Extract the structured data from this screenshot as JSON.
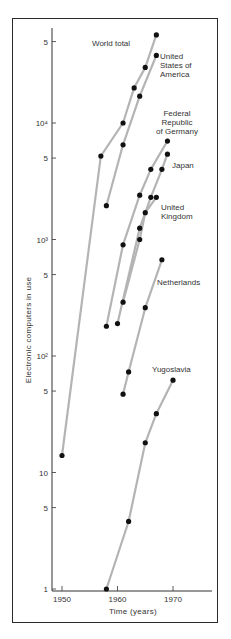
{
  "chart_data": {
    "type": "line",
    "title": "",
    "xlabel": "Time  (years)",
    "ylabel": "Electronic computers in use",
    "yscale": "log",
    "ylim": [
      1,
      60000
    ],
    "xlim": [
      1948,
      1976
    ],
    "grid": false,
    "legend": "inline labels",
    "x_ticks": [
      {
        "value": 1950,
        "label": "1950"
      },
      {
        "value": 1960,
        "label": "1960"
      },
      {
        "value": 1970,
        "label": "1970"
      }
    ],
    "y_ticks": [
      {
        "value": 1,
        "label": "1"
      },
      {
        "value": 5,
        "label": "5"
      },
      {
        "value": 10,
        "label": "10"
      },
      {
        "value": 50,
        "label": "5"
      },
      {
        "value": 100,
        "label": "10²"
      },
      {
        "value": 500,
        "label": "5"
      },
      {
        "value": 1000,
        "label": "10³"
      },
      {
        "value": 5000,
        "label": "5"
      },
      {
        "value": 10000,
        "label": "10⁴"
      },
      {
        "value": 50000,
        "label": "5"
      }
    ],
    "series": [
      {
        "name": "World  total",
        "label_lines": [
          "World  total"
        ],
        "label_pos": [
          92,
          46
        ],
        "label_anchor": "start",
        "points": [
          [
            1950,
            14
          ],
          [
            1957,
            5200
          ],
          [
            1961,
            10000
          ],
          [
            1963,
            20000
          ],
          [
            1965,
            30000
          ],
          [
            1967,
            57000
          ]
        ]
      },
      {
        "name": "United States of America",
        "label_lines": [
          "United",
          "States  of",
          "America"
        ],
        "label_pos": [
          160,
          59
        ],
        "label_anchor": "start",
        "points": [
          [
            1958,
            1950
          ],
          [
            1961,
            6500
          ],
          [
            1964,
            17000
          ],
          [
            1967,
            38000
          ]
        ]
      },
      {
        "name": "Federal Republic of Germany",
        "label_lines": [
          "Federal",
          "Republic",
          "of  Germany"
        ],
        "label_pos": [
          177,
          116
        ],
        "label_anchor": "middle",
        "points": [
          [
            1958,
            180
          ],
          [
            1961,
            900
          ],
          [
            1964,
            2400
          ],
          [
            1966,
            4000
          ],
          [
            1969,
            7000
          ]
        ]
      },
      {
        "name": "Japan",
        "label_lines": [
          "Japan"
        ],
        "label_pos": [
          172,
          168
        ],
        "label_anchor": "start",
        "points": [
          [
            1960,
            190
          ],
          [
            1964,
            1250
          ],
          [
            1966,
            2300
          ],
          [
            1968,
            4000
          ],
          [
            1969,
            5400
          ]
        ]
      },
      {
        "name": "United Kingdom",
        "label_lines": [
          "United",
          "Kingdom"
        ],
        "label_pos": [
          161,
          210
        ],
        "label_anchor": "start",
        "points": [
          [
            1961,
            290
          ],
          [
            1964,
            1000
          ],
          [
            1965,
            1700
          ],
          [
            1967,
            2300
          ]
        ]
      },
      {
        "name": "Netherlands",
        "label_lines": [
          "Netherlands"
        ],
        "label_pos": [
          157,
          285
        ],
        "label_anchor": "start",
        "points": [
          [
            1961,
            47
          ],
          [
            1962,
            73
          ],
          [
            1965,
            260
          ],
          [
            1968,
            670
          ]
        ]
      },
      {
        "name": "Yugoslavia",
        "label_lines": [
          "Yugoslavia"
        ],
        "label_pos": [
          152,
          372
        ],
        "label_anchor": "start",
        "points": [
          [
            1958,
            1
          ],
          [
            1962,
            3.8
          ],
          [
            1965,
            18
          ],
          [
            1967,
            32
          ],
          [
            1970,
            62
          ]
        ]
      }
    ]
  },
  "style": {
    "line_color": "#b4b4b4",
    "point_color": "#111111",
    "axis_color": "#333333",
    "frame_color": "#2a2a2a"
  }
}
